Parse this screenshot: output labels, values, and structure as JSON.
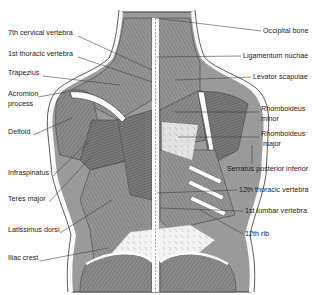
{
  "figure": {
    "labels_left": [
      {
        "text": "7th cervical vertebra",
        "x": 8,
        "y": 33
      },
      {
        "text": "1st thoracic vertebra",
        "x": 8,
        "y": 54
      },
      {
        "text": "Trapezius",
        "x": 8,
        "y": 73
      },
      {
        "text": "Acromion",
        "x": 8,
        "y": 94
      },
      {
        "text": "process",
        "x": 8,
        "y": 104
      },
      {
        "text": "Deltoid",
        "x": 8,
        "y": 132
      },
      {
        "text": "Infraspinatus",
        "x": 8,
        "y": 173
      },
      {
        "text": "Teres major",
        "x": 8,
        "y": 199
      },
      {
        "text": "Latissimus dorsi",
        "x": 8,
        "y": 230
      },
      {
        "text": "Iliac crest",
        "x": 8,
        "y": 258
      }
    ],
    "labels_right": [
      {
        "text": "Occipital bone",
        "x": 263,
        "y": 28
      },
      {
        "text": "Ligamentum nuchae",
        "x": 243,
        "y": 53
      },
      {
        "text": "Levator scapulae",
        "x": 253,
        "y": 74
      },
      {
        "text": "Rhomboideus",
        "x": 261,
        "y": 106
      },
      {
        "text": "minor",
        "x": 261,
        "y": 116
      },
      {
        "text": "Rhomboideus",
        "x": 261,
        "y": 131
      },
      {
        "text": "major",
        "x": 263,
        "y": 141
      },
      {
        "text": "Serratus posterior inferior",
        "x": 227,
        "y": 165
      },
      {
        "text": "12th thoracic vertebra",
        "x": 239,
        "y": 187
      },
      {
        "text": "1st lumbar vertebra",
        "x": 245,
        "y": 208
      },
      {
        "text": "12th rib",
        "x": 245,
        "y": 232
      }
    ],
    "colors": {
      "muscle": "#8a8a8a",
      "muscle_dark": "#5a5a5a",
      "bone": "#ffffff",
      "outline": "#333333",
      "leader": "#444444"
    }
  }
}
